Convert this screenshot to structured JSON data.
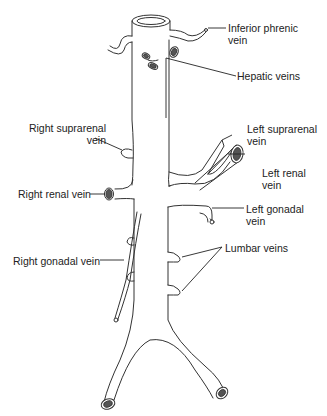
{
  "diagram": {
    "labels": {
      "inferior_phrenic_vein": {
        "line1": "Inferior phrenic",
        "line2": "vein"
      },
      "hepatic_veins": {
        "line1": "Hepatic veins"
      },
      "right_suprarenal_vein": {
        "line1": "Right suprarenal",
        "line2": "vein"
      },
      "left_suprarenal_vein": {
        "line1": "Left suprarenal",
        "line2": "vein"
      },
      "right_renal_vein": {
        "line1": "Right renal vein"
      },
      "left_renal_vein": {
        "line1": "Left renal",
        "line2": "vein"
      },
      "left_gonadal_vein": {
        "line1": "Left gonadal",
        "line2": "vein"
      },
      "right_gonadal_vein": {
        "line1": "Right gonadal vein"
      },
      "lumbar_veins": {
        "line1": "Lumbar veins"
      }
    },
    "colors": {
      "line": "#333333",
      "lumen": "#555555",
      "background": "#ffffff"
    }
  }
}
